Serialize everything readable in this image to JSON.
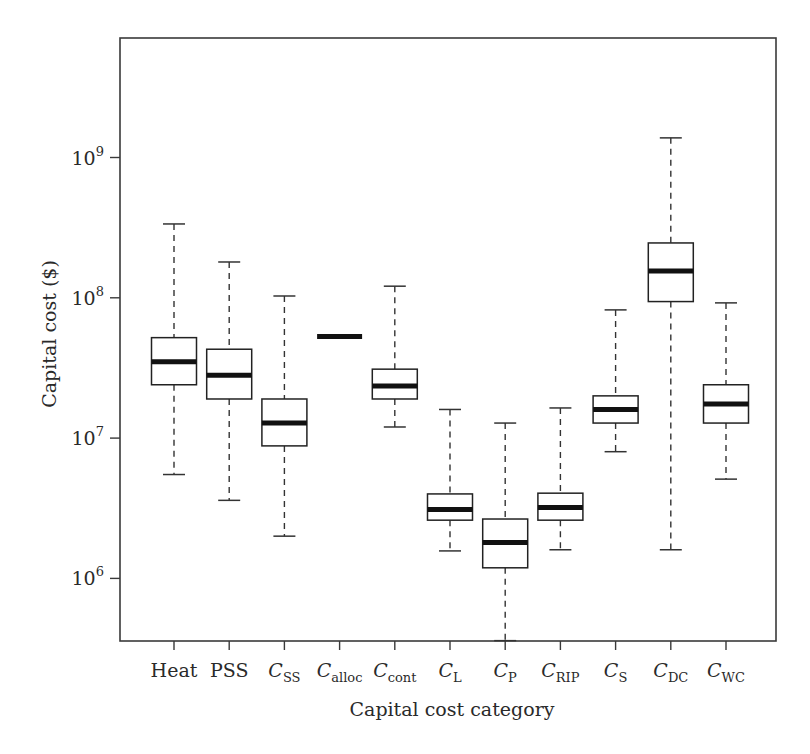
{
  "chart_data": {
    "type": "box",
    "title": "",
    "xlabel": "Capital cost category",
    "ylabel": "Capital cost ($)",
    "yscale": "log",
    "ylim": [
      360000,
      7200000000
    ],
    "yticks": [
      {
        "value": 1000000,
        "base": "10",
        "exp": "6"
      },
      {
        "value": 10000000,
        "base": "10",
        "exp": "7"
      },
      {
        "value": 100000000,
        "base": "10",
        "exp": "8"
      },
      {
        "value": 1000000000,
        "base": "10",
        "exp": "9"
      }
    ],
    "grid": false,
    "legend": null,
    "categories": [
      {
        "label": "Heat",
        "main": "Heat",
        "sub": ""
      },
      {
        "label": "PSS",
        "main": "PSS",
        "sub": ""
      },
      {
        "label": "C_SS",
        "main": "C",
        "sub": "SS"
      },
      {
        "label": "C_alloc",
        "main": "C",
        "sub": "alloc"
      },
      {
        "label": "C_cont",
        "main": "C",
        "sub": "cont"
      },
      {
        "label": "C_L",
        "main": "C",
        "sub": "L"
      },
      {
        "label": "C_P",
        "main": "C",
        "sub": "P"
      },
      {
        "label": "C_RIP",
        "main": "C",
        "sub": "RIP"
      },
      {
        "label": "C_S",
        "main": "C",
        "sub": "S"
      },
      {
        "label": "C_DC",
        "main": "C",
        "sub": "DC"
      },
      {
        "label": "C_WC",
        "main": "C",
        "sub": "WC"
      }
    ],
    "boxes": [
      {
        "category": "Heat",
        "whisker_low": 5500000,
        "q1": 24000000,
        "median": 35000000,
        "q3": 52000000,
        "whisker_high": 336000000
      },
      {
        "category": "PSS",
        "whisker_low": 3600000,
        "q1": 19000000,
        "median": 28000000,
        "q3": 43000000,
        "whisker_high": 180000000
      },
      {
        "category": "C_SS",
        "whisker_low": 2000000,
        "q1": 8800000,
        "median": 12800000,
        "q3": 19000000,
        "whisker_high": 103000000
      },
      {
        "category": "C_alloc",
        "whisker_low": 53000000,
        "q1": 53000000,
        "median": 53000000,
        "q3": 53000000,
        "whisker_high": 53000000
      },
      {
        "category": "C_cont",
        "whisker_low": 12000000,
        "q1": 19000000,
        "median": 23500000,
        "q3": 31000000,
        "whisker_high": 121000000
      },
      {
        "category": "C_L",
        "whisker_low": 1570000,
        "q1": 2600000,
        "median": 3100000,
        "q3": 4000000,
        "whisker_high": 16000000
      },
      {
        "category": "C_P",
        "whisker_low": 360000,
        "q1": 1190000,
        "median": 1800000,
        "q3": 2650000,
        "whisker_high": 12800000
      },
      {
        "category": "C_RIP",
        "whisker_low": 1600000,
        "q1": 2600000,
        "median": 3200000,
        "q3": 4050000,
        "whisker_high": 16400000
      },
      {
        "category": "C_S",
        "whisker_low": 8000000,
        "q1": 12800000,
        "median": 16000000,
        "q3": 20000000,
        "whisker_high": 82000000
      },
      {
        "category": "C_DC",
        "whisker_low": 1600000,
        "q1": 94000000,
        "median": 155000000,
        "q3": 246000000,
        "whisker_high": 1380000000
      },
      {
        "category": "C_WC",
        "whisker_low": 5100000,
        "q1": 12800000,
        "median": 17500000,
        "q3": 24000000,
        "whisker_high": 92000000
      }
    ],
    "colors": {
      "box_fill": "#ffffff",
      "box_stroke": "#222222",
      "median": "#111111",
      "axis": "#3a3a3a"
    }
  }
}
